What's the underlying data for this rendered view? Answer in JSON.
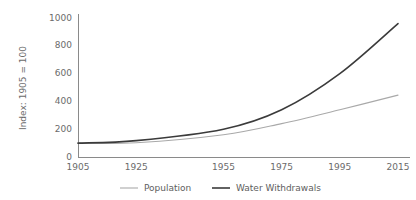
{
  "chart_data": {
    "type": "line",
    "title": "",
    "xlabel": "",
    "ylabel": "Index: 1905 = 100",
    "x": [
      1905,
      1925,
      1955,
      1975,
      1995,
      2015
    ],
    "categories": [
      "1905",
      "1925",
      "1955",
      "1975",
      "1995",
      "2015"
    ],
    "series": [
      {
        "name": "Population",
        "color": "#a9a9a9",
        "values": [
          100,
          103,
          160,
          240,
          340,
          445
        ]
      },
      {
        "name": "Water Withdrawals",
        "color": "#3b3b3b",
        "values": [
          100,
          118,
          200,
          340,
          600,
          960
        ]
      }
    ],
    "ylim": [
      0,
      1000
    ],
    "yticks": [
      0,
      200,
      400,
      600,
      800,
      1000
    ],
    "ytick_labels": [
      "0",
      "200",
      "400",
      "600",
      "800",
      "1000"
    ],
    "xlim": [
      1905,
      2015
    ],
    "grid": false,
    "legend_position": "bottom"
  },
  "axis": {
    "y_title": "Index: 1905 = 100"
  },
  "legend": {
    "items": [
      {
        "label": "Population"
      },
      {
        "label": "Water Withdrawals"
      }
    ]
  }
}
